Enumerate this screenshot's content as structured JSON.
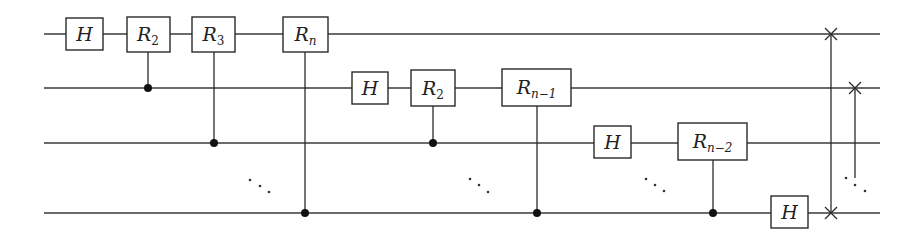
{
  "diagram": {
    "type": "quantum-circuit",
    "qubit_count_shown": 4,
    "wires": [
      {
        "id": "q1",
        "label": ""
      },
      {
        "id": "q2",
        "label": ""
      },
      {
        "id": "q3",
        "label": ""
      },
      {
        "id": "qn",
        "label": ""
      }
    ],
    "gates": [
      {
        "id": "g1",
        "kind": "single",
        "target": 0,
        "label": "H",
        "sub": ""
      },
      {
        "id": "g2",
        "kind": "controlled",
        "target": 0,
        "control": 1,
        "label": "R",
        "sub": "2"
      },
      {
        "id": "g3",
        "kind": "controlled",
        "target": 0,
        "control": 2,
        "label": "R",
        "sub": "3"
      },
      {
        "id": "g4",
        "kind": "controlled",
        "target": 0,
        "control": 3,
        "label": "R",
        "sub": "n"
      },
      {
        "id": "g5",
        "kind": "single",
        "target": 1,
        "label": "H",
        "sub": ""
      },
      {
        "id": "g6",
        "kind": "controlled",
        "target": 1,
        "control": 2,
        "label": "R",
        "sub": "2"
      },
      {
        "id": "g7",
        "kind": "controlled",
        "target": 1,
        "control": 3,
        "label": "R",
        "sub": "n−1"
      },
      {
        "id": "g8",
        "kind": "single",
        "target": 2,
        "label": "H",
        "sub": ""
      },
      {
        "id": "g9",
        "kind": "controlled",
        "target": 2,
        "control": 3,
        "label": "R",
        "sub": "n−2"
      },
      {
        "id": "g10",
        "kind": "single",
        "target": 3,
        "label": "H",
        "sub": ""
      }
    ],
    "swaps": [
      {
        "id": "s1",
        "from": 0,
        "to": 3
      },
      {
        "id": "s2",
        "from": 1,
        "to": "ellipsis"
      }
    ],
    "ellipses": [
      "⋱",
      "⋱",
      "⋱",
      "⋱"
    ]
  }
}
